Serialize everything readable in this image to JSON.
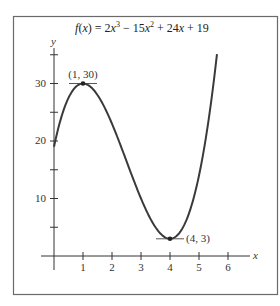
{
  "chart_data": {
    "type": "line",
    "title_parts": {
      "f": "f",
      "lparen": "(",
      "x1": "x",
      "eq": ") = 2",
      "x2": "x",
      "exp3": "3",
      "minus": " − 15",
      "x3": "x",
      "exp2": "2",
      "plus24": " + 24",
      "x4": "x",
      "plus19": " + 19"
    },
    "function": {
      "coefficients": {
        "a3": 2,
        "a2": -15,
        "a1": 24,
        "a0": 19
      },
      "x_start": 0,
      "x_end": 5.62
    },
    "xlabel": "x",
    "ylabel": "y",
    "x_ticks": [
      1,
      2,
      3,
      4,
      5,
      6
    ],
    "x_tick_labels": [
      "1",
      "2",
      "3",
      "4",
      "5",
      "6"
    ],
    "y_ticks": [
      5,
      10,
      15,
      20,
      25,
      30,
      35
    ],
    "y_tick_labels": {
      "10": "10",
      "20": "20",
      "30": "30"
    },
    "xlim": [
      -0.4,
      7.1
    ],
    "ylim": [
      -2,
      36
    ],
    "grid": false,
    "legend": null,
    "annotations": [
      {
        "x": 1,
        "y": 30,
        "label": "(1, 30)",
        "type": "local maximum"
      },
      {
        "x": 4,
        "y": 3,
        "label": "(4, 3)",
        "type": "local minimum"
      }
    ],
    "series": [
      {
        "name": "f(x)",
        "x": [
          0,
          0.5,
          1,
          1.5,
          2,
          2.5,
          3,
          3.5,
          4,
          4.5,
          5,
          5.5,
          5.62
        ],
        "values": [
          19,
          27.75,
          30,
          28.25,
          23,
          15.75,
          10,
          4.25,
          3,
          5.75,
          14,
          30,
          34.3
        ]
      }
    ]
  },
  "labels": {
    "x_axis": "x",
    "y_axis": "y",
    "max_point": "(1, 30)",
    "min_point": "(4, 3)",
    "ytick_10": "10",
    "ytick_20": "20",
    "ytick_30": "30",
    "xtick_1": "1",
    "xtick_2": "2",
    "xtick_3": "3",
    "xtick_4": "4",
    "xtick_5": "5",
    "xtick_6": "6"
  },
  "colors": {
    "frame": "#6a6a6a",
    "curve": "#3a3a3a",
    "axis": "#333333",
    "background": "#ffffff"
  }
}
